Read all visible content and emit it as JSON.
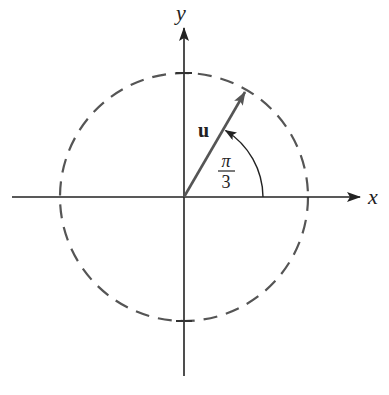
{
  "diagram": {
    "axes": {
      "x_label": "x",
      "y_label": "y",
      "origin": [
        184,
        197
      ],
      "x_range_px": [
        12,
        372
      ],
      "y_range_px": [
        376,
        26
      ]
    },
    "circle": {
      "style": "dashed",
      "center": [
        184,
        197
      ],
      "radius_px": 124,
      "color": "#555555"
    },
    "vector": {
      "label": "u",
      "angle_rad_label_num": "π",
      "angle_rad_label_den": "3",
      "angle_deg": 60,
      "length_px": 124,
      "color": "#555555"
    },
    "angle_arc": {
      "radius_px": 79,
      "from_deg": 0,
      "to_deg": 60,
      "color": "#222222"
    },
    "colors": {
      "axis": "#222222",
      "dashed_circle": "#555555",
      "vector": "#555555",
      "text": "#222222"
    }
  }
}
